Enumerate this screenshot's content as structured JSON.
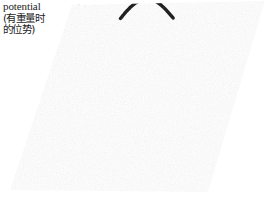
{
  "figure": {
    "width": 270,
    "height": 207,
    "background_color": "#ffffff",
    "ink_color": "#000000"
  },
  "caption": {
    "line_en": "potential",
    "line_cjk_1": "(有重量时",
    "line_cjk_2": "的位势)",
    "color": "#1d1d1d"
  },
  "cutoff_caption": {
    "left_fragment": "",
    "right_fragment": ""
  },
  "chart_data": {
    "type": "surface",
    "title": "potential",
    "subtitle": "(有重量时的位势)",
    "render_style": "hidden-line scan-line wireframe",
    "xlabel": "",
    "ylabel": "",
    "zlabel": "potential",
    "grid": false,
    "legend": null,
    "axis_ticks": [],
    "projection": {
      "kind": "oblique-parallelogram",
      "corners_px": {
        "top_left": [
          72,
          5
        ],
        "top_right": [
          265,
          1
        ],
        "bottom_right": [
          208,
          192
        ],
        "bottom_left": [
          10,
          190
        ]
      },
      "shear_x_px": -62,
      "rows": 74
    },
    "surface": {
      "function": "gaussian-peak",
      "peak_center_uv": [
        0.5,
        0.42
      ],
      "peak_amplitude_px": 74,
      "sigma_u": 0.17,
      "sigma_v": 0.22,
      "baseline_level": 0.0,
      "summit_marker": "dark arc ridge at apex"
    },
    "x": [
      0.0,
      0.1,
      0.2,
      0.3,
      0.4,
      0.5,
      0.6,
      0.7,
      0.8,
      0.9,
      1.0
    ],
    "y": [
      0.0,
      0.1,
      0.2,
      0.3,
      0.4,
      0.5,
      0.6,
      0.7,
      0.8,
      0.9,
      1.0
    ],
    "z": [
      [
        0.0,
        0.0,
        0.01,
        0.01,
        0.02,
        0.02,
        0.02,
        0.01,
        0.01,
        0.0,
        0.0
      ],
      [
        0.0,
        0.01,
        0.02,
        0.04,
        0.06,
        0.07,
        0.06,
        0.04,
        0.02,
        0.01,
        0.0
      ],
      [
        0.01,
        0.02,
        0.05,
        0.11,
        0.17,
        0.2,
        0.17,
        0.11,
        0.05,
        0.02,
        0.01
      ],
      [
        0.01,
        0.04,
        0.11,
        0.25,
        0.4,
        0.47,
        0.4,
        0.25,
        0.11,
        0.04,
        0.01
      ],
      [
        0.02,
        0.06,
        0.17,
        0.4,
        0.68,
        0.83,
        0.68,
        0.4,
        0.17,
        0.06,
        0.02
      ],
      [
        0.02,
        0.07,
        0.2,
        0.47,
        0.83,
        1.0,
        0.83,
        0.47,
        0.2,
        0.07,
        0.02
      ],
      [
        0.02,
        0.06,
        0.17,
        0.4,
        0.68,
        0.83,
        0.68,
        0.4,
        0.17,
        0.06,
        0.02
      ],
      [
        0.01,
        0.04,
        0.11,
        0.25,
        0.4,
        0.47,
        0.4,
        0.25,
        0.11,
        0.04,
        0.01
      ],
      [
        0.01,
        0.02,
        0.05,
        0.11,
        0.17,
        0.2,
        0.17,
        0.11,
        0.05,
        0.02,
        0.01
      ],
      [
        0.0,
        0.01,
        0.02,
        0.04,
        0.06,
        0.07,
        0.06,
        0.04,
        0.02,
        0.01,
        0.0
      ],
      [
        0.0,
        0.0,
        0.01,
        0.01,
        0.02,
        0.02,
        0.02,
        0.01,
        0.01,
        0.0,
        0.0
      ]
    ],
    "zlim": [
      0.0,
      1.0
    ]
  }
}
